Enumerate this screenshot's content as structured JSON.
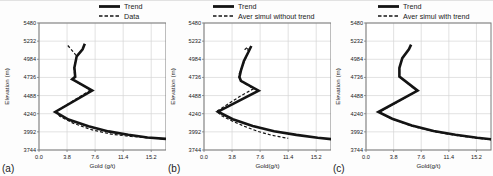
{
  "figure": {
    "background": "#fdfdfd",
    "line_color": "#141414",
    "grid_color": "#d6d6d6",
    "border_color": "#7a7a7a",
    "text_color": "#1a1a1a"
  },
  "chart_data": [
    {
      "type": "line",
      "panel_label": "(a)",
      "title": "",
      "xlabel": "Gold (g/t)",
      "ylabel": "Elevation  (m)",
      "xlim": [
        0,
        17.2
      ],
      "ylim": [
        3744,
        5480
      ],
      "xtick_values": [
        0,
        3.8,
        7.6,
        11.4,
        15.2
      ],
      "xtick_labels": [
        "0.0",
        "3.8",
        "7.6",
        "11.4",
        "15.2"
      ],
      "ytick_values": [
        3744,
        3992,
        4240,
        4488,
        4736,
        4984,
        5232,
        5480
      ],
      "ytick_labels": [
        "3744",
        "3992",
        "4240",
        "4488",
        "4736",
        "4984",
        "5232",
        "5480"
      ],
      "grid": true,
      "legend_position": "top",
      "series": [
        {
          "name": "Trend",
          "style": "solid",
          "points": [
            [
              6.2,
              5195
            ],
            [
              5.9,
              5120
            ],
            [
              5.1,
              5025
            ],
            [
              4.8,
              4870
            ],
            [
              4.9,
              4745
            ],
            [
              4.5,
              4712
            ],
            [
              4.9,
              4688
            ],
            [
              7.2,
              4558
            ],
            [
              2.2,
              4264
            ],
            [
              4.0,
              4160
            ],
            [
              6.7,
              4068
            ],
            [
              9.4,
              3998
            ],
            [
              12.1,
              3952
            ],
            [
              14.7,
              3915
            ],
            [
              17.2,
              3896
            ]
          ]
        },
        {
          "name": "Data",
          "style": "dashed",
          "points": [
            [
              3.9,
              5172
            ],
            [
              4.7,
              5080
            ],
            [
              5.1,
              5025
            ],
            [
              4.75,
              4870
            ],
            [
              4.85,
              4745
            ],
            [
              4.5,
              4712
            ],
            [
              4.85,
              4688
            ],
            [
              7.0,
              4565
            ],
            [
              2.3,
              4270
            ],
            [
              2.8,
              4204
            ],
            [
              4.6,
              4112
            ],
            [
              7.1,
              4022
            ],
            [
              9.8,
              3960
            ],
            [
              12.5,
              3928
            ],
            [
              15.2,
              3906
            ],
            [
              17.1,
              3894
            ]
          ]
        }
      ]
    },
    {
      "type": "line",
      "panel_label": "(b)",
      "title": "",
      "xlabel": "Gold(g/t)",
      "ylabel": "Elevation  (m)",
      "xlim": [
        0,
        17.2
      ],
      "ylim": [
        3744,
        5480
      ],
      "xtick_values": [
        0,
        3.8,
        7.6,
        11.4,
        15.2
      ],
      "xtick_labels": [
        "0.0",
        "3.8",
        "7.6",
        "11.4",
        "15.2"
      ],
      "ytick_values": [
        3744,
        3992,
        4240,
        4488,
        4736,
        4984,
        5232,
        5480
      ],
      "ytick_labels": [
        "3744",
        "3992",
        "4240",
        "4488",
        "4736",
        "4984",
        "5232",
        "5480"
      ],
      "grid": true,
      "legend_position": "top",
      "series": [
        {
          "name": "Trend",
          "style": "solid",
          "points": [
            [
              6.4,
              5165
            ],
            [
              6.0,
              5080
            ],
            [
              5.4,
              4960
            ],
            [
              5.0,
              4830
            ],
            [
              4.8,
              4740
            ],
            [
              5.0,
              4690
            ],
            [
              7.4,
              4556
            ],
            [
              1.9,
              4268
            ],
            [
              3.9,
              4165
            ],
            [
              6.6,
              4072
            ],
            [
              9.5,
              4000
            ],
            [
              12.5,
              3950
            ],
            [
              15.4,
              3912
            ],
            [
              17.3,
              3892
            ]
          ]
        },
        {
          "name": "Aver simul without trend",
          "style": "dashed",
          "points": [
            [
              5.5,
              5115
            ],
            [
              5.9,
              5150
            ],
            [
              6.0,
              5085
            ],
            [
              5.6,
              4985
            ],
            [
              5.1,
              4870
            ],
            [
              4.7,
              4765
            ],
            [
              4.9,
              4692
            ],
            [
              6.7,
              4580
            ],
            [
              4.9,
              4480
            ],
            [
              1.7,
              4272
            ],
            [
              2.4,
              4212
            ],
            [
              3.8,
              4140
            ],
            [
              5.5,
              4066
            ],
            [
              7.3,
              3998
            ],
            [
              9.1,
              3948
            ],
            [
              10.6,
              3918
            ],
            [
              11.4,
              3904
            ]
          ]
        }
      ]
    },
    {
      "type": "line",
      "panel_label": "(c)",
      "title": "",
      "xlabel": "Gold(g/t)",
      "ylabel": "Elevation  (m)",
      "xlim": [
        0,
        17.2
      ],
      "ylim": [
        3744,
        5480
      ],
      "xtick_values": [
        0,
        3.8,
        7.6,
        11.4,
        15.2
      ],
      "xtick_labels": [
        "0.0",
        "3.8",
        "7.6",
        "11.4",
        "15.2"
      ],
      "ytick_values": [
        3744,
        3992,
        4240,
        4488,
        4736,
        4984,
        5232,
        5480
      ],
      "ytick_labels": [
        "3744",
        "3992",
        "4240",
        "4488",
        "4736",
        "4984",
        "5232",
        "5480"
      ],
      "grid": true,
      "legend_position": "top",
      "series": [
        {
          "name": "Trend",
          "style": "solid",
          "points": [
            [
              6.2,
              5185
            ],
            [
              5.9,
              5120
            ],
            [
              5.0,
              5000
            ],
            [
              4.6,
              4865
            ],
            [
              4.6,
              4748
            ],
            [
              7.1,
              4556
            ],
            [
              1.7,
              4264
            ],
            [
              3.6,
              4172
            ],
            [
              6.3,
              4078
            ],
            [
              9.3,
              4002
            ],
            [
              12.3,
              3952
            ],
            [
              15.3,
              3912
            ],
            [
              17.2,
              3892
            ]
          ]
        },
        {
          "name": "Aver simul with trend",
          "style": "dashed",
          "points": [
            [
              4.7,
              4742
            ],
            [
              7.0,
              4550
            ],
            [
              1.8,
              4260
            ],
            [
              3.7,
              4164
            ],
            [
              6.4,
              4070
            ],
            [
              9.4,
              3994
            ],
            [
              12.4,
              3944
            ],
            [
              15.4,
              3904
            ],
            [
              17.2,
              3884
            ]
          ]
        }
      ]
    }
  ]
}
